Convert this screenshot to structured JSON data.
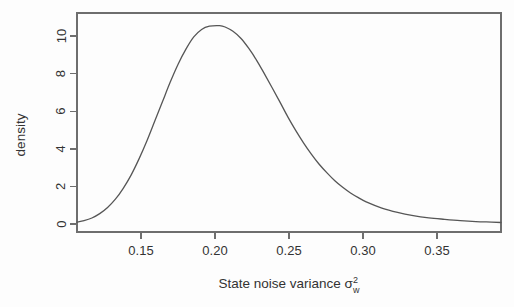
{
  "chart_data": {
    "type": "line",
    "title": "",
    "subtitle": "",
    "xlabel": "State noise variance σ²_w",
    "xlabel_parts": {
      "text": "State noise variance",
      "symbol": "σ",
      "superscript": "2",
      "subscript": "w"
    },
    "ylabel": "density",
    "xlim": [
      0.1155,
      0.386
    ],
    "ylim": [
      0.0,
      11.0
    ],
    "xticks": [
      0.15,
      0.2,
      0.25,
      0.3,
      0.35
    ],
    "xtick_labels": [
      "0.15",
      "0.20",
      "0.25",
      "0.30",
      "0.35"
    ],
    "yticks": [
      0,
      2,
      4,
      6,
      8,
      10
    ],
    "ytick_labels": [
      "0",
      "2",
      "4",
      "6",
      "8",
      "10"
    ],
    "grid": false,
    "legend": null,
    "box": true,
    "peak": {
      "x": 0.2065,
      "y": 10.55
    },
    "line_color": "#565656",
    "axis_color": "#6e6e6e",
    "background_color": "#fdfdfd",
    "series": [
      {
        "name": "posterior density",
        "x": [
          0.1155,
          0.12,
          0.125,
          0.13,
          0.135,
          0.14,
          0.145,
          0.15,
          0.155,
          0.16,
          0.165,
          0.17,
          0.175,
          0.18,
          0.185,
          0.19,
          0.195,
          0.2,
          0.2065,
          0.21,
          0.215,
          0.22,
          0.225,
          0.23,
          0.235,
          0.24,
          0.245,
          0.25,
          0.255,
          0.26,
          0.265,
          0.27,
          0.275,
          0.28,
          0.285,
          0.29,
          0.295,
          0.3,
          0.31,
          0.32,
          0.33,
          0.34,
          0.35,
          0.36,
          0.37,
          0.38,
          0.386
        ],
        "y": [
          0.1,
          0.18,
          0.32,
          0.55,
          0.88,
          1.32,
          1.9,
          2.6,
          3.45,
          4.4,
          5.45,
          6.5,
          7.55,
          8.5,
          9.3,
          9.95,
          10.35,
          10.52,
          10.55,
          10.48,
          10.25,
          9.88,
          9.35,
          8.72,
          8.0,
          7.25,
          6.48,
          5.7,
          4.98,
          4.32,
          3.72,
          3.18,
          2.72,
          2.3,
          1.95,
          1.65,
          1.4,
          1.18,
          0.85,
          0.62,
          0.45,
          0.33,
          0.25,
          0.18,
          0.13,
          0.1,
          0.08
        ]
      }
    ]
  },
  "axes": {
    "y_axis_label": "density",
    "x_axis_label_text": "State noise variance",
    "x_axis_symbol": "σ",
    "x_axis_superscript": "2",
    "x_axis_subscript": "w"
  }
}
